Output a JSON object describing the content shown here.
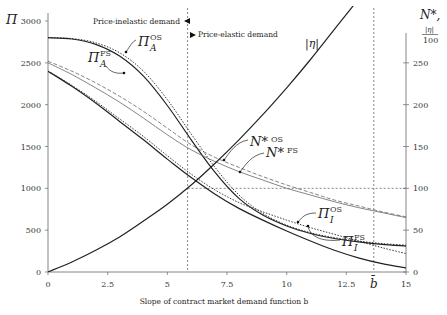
{
  "chart_data": {
    "type": "line",
    "title": "",
    "xlabel": "Slope of contract market demand function b",
    "ylabel_left": "Π",
    "ylabel_right": "N*, |η|/100",
    "xlim": [
      0,
      15
    ],
    "ylim_left": [
      0,
      3000
    ],
    "ylim_right": [
      0,
      300
    ],
    "x_ticks": [
      "0",
      "2.5",
      "5",
      "7.5",
      "10",
      "12.5",
      "15"
    ],
    "x_tick_values": [
      0,
      2.5,
      5,
      7.5,
      10,
      12.5,
      15
    ],
    "y_left_ticks": [
      "0",
      "500",
      "1000",
      "1500",
      "2000",
      "2500",
      "3000"
    ],
    "y_left_tick_values": [
      0,
      500,
      1000,
      1500,
      2000,
      2500,
      3000
    ],
    "y_right_ticks": [
      "0",
      "50",
      "100",
      "150",
      "200",
      "250"
    ],
    "y_right_tick_values": [
      0,
      50,
      100,
      150,
      200,
      250
    ],
    "b_bar_label": "b̄",
    "b_bar_value": 13.65,
    "elasticity_threshold_b": 5.85,
    "reference_line_right": 100,
    "annotations": {
      "inelastic": "Price-inelastic demand",
      "elastic": "Price-elastic demand"
    },
    "x": [
      0,
      1,
      2,
      3,
      4,
      5,
      6,
      7,
      8,
      9,
      10,
      11,
      12,
      13,
      14,
      15
    ],
    "series": [
      {
        "name": "Π_A^OS",
        "axis": "left",
        "style": "dotted",
        "values": [
          2800,
          2790,
          2740,
          2620,
          2400,
          2060,
          1650,
          1250,
          920,
          700,
          560,
          470,
          410,
          370,
          340,
          320
        ]
      },
      {
        "name": "Π_A^FS",
        "axis": "left",
        "style": "solid",
        "values": [
          2800,
          2785,
          2720,
          2580,
          2340,
          1990,
          1580,
          1190,
          880,
          680,
          550,
          460,
          400,
          360,
          330,
          310
        ]
      },
      {
        "name": "N*^OS",
        "axis": "right",
        "style": "dashed",
        "values": [
          252,
          240,
          226,
          210,
          192,
          172,
          152,
          137,
          125,
          114,
          104,
          95,
          86,
          79,
          72,
          66
        ]
      },
      {
        "name": "N*^FS",
        "axis": "right",
        "style": "solid-thin",
        "values": [
          250,
          236,
          220,
          203,
          184,
          164,
          146,
          132,
          120,
          110,
          100,
          92,
          84,
          77,
          71,
          65
        ]
      },
      {
        "name": "Π_I^OS",
        "axis": "left",
        "style": "dotted",
        "values": [
          2400,
          2230,
          2040,
          1830,
          1620,
          1390,
          1170,
          980,
          830,
          720,
          620,
          530,
          450,
          370,
          290,
          220
        ]
      },
      {
        "name": "Π_I^FS",
        "axis": "left",
        "style": "solid",
        "values": [
          2400,
          2220,
          2020,
          1800,
          1580,
          1350,
          1130,
          930,
          760,
          620,
          490,
          370,
          260,
          170,
          100,
          50
        ]
      },
      {
        "name": "|η|",
        "axis": "right",
        "style": "solid",
        "values": [
          0,
          12,
          26,
          42,
          61,
          81,
          104,
          130,
          158,
          188,
          220,
          254,
          290,
          326,
          364,
          402
        ]
      }
    ],
    "labels": {
      "pi_A_OS": {
        "base": "Π",
        "sub": "A",
        "sup": "OS"
      },
      "pi_A_FS": {
        "base": "Π",
        "sub": "A",
        "sup": "FS"
      },
      "n_OS": {
        "base": "N*",
        "sup": "OS"
      },
      "n_FS": {
        "base": "N*",
        "sup": "FS"
      },
      "pi_I_OS": {
        "base": "Π",
        "sub": "I",
        "sup": "OS"
      },
      "pi_I_FS": {
        "base": "Π",
        "sub": "I",
        "sup": "FS"
      },
      "eta": "|η|"
    },
    "grid": false,
    "legend": "none (inline labels)"
  }
}
